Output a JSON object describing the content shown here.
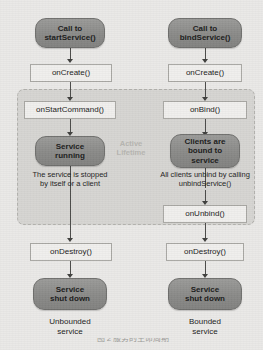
{
  "figure": {
    "lifetime_label_line1": "Active",
    "lifetime_label_line2": "Lifetime",
    "colors": {
      "background": "#eae9e7",
      "lifetime_box": "#d6d5d2",
      "pill_node": "#8e8e8c",
      "callback_box": "#f0efed",
      "arrow": "#4a4a48",
      "lifetime_label_text": "#b6b5b1"
    }
  },
  "left_column": {
    "caption_line1": "Unbounded",
    "caption_line2": "service",
    "start_line1": "Call to",
    "start_line2": "startService()",
    "on_create": "onCreate()",
    "on_start_command": "onStartCommand()",
    "running_line1": "Service",
    "running_line2": "running",
    "note_line1": "The service is stopped",
    "note_line2": "by itself or a client",
    "on_destroy": "onDestroy()",
    "shutdown_line1": "Service",
    "shutdown_line2": "shut down"
  },
  "right_column": {
    "caption_line1": "Bounded",
    "caption_line2": "service",
    "start_line1": "Call to",
    "start_line2": "bindService()",
    "on_create": "onCreate()",
    "on_bind": "onBind()",
    "bound_line1": "Clients are",
    "bound_line2": "bound to",
    "bound_line3": "service",
    "note_line1": "All clients unbind by calling",
    "note_line2": "unbindService()",
    "on_unbind": "onUnbind()",
    "on_destroy": "onDestroy()",
    "shutdown_line1": "Service",
    "shutdown_line2": "shut down"
  },
  "bottom_caption": {
    "clipped_text": "图 2 服务的生命周期"
  }
}
